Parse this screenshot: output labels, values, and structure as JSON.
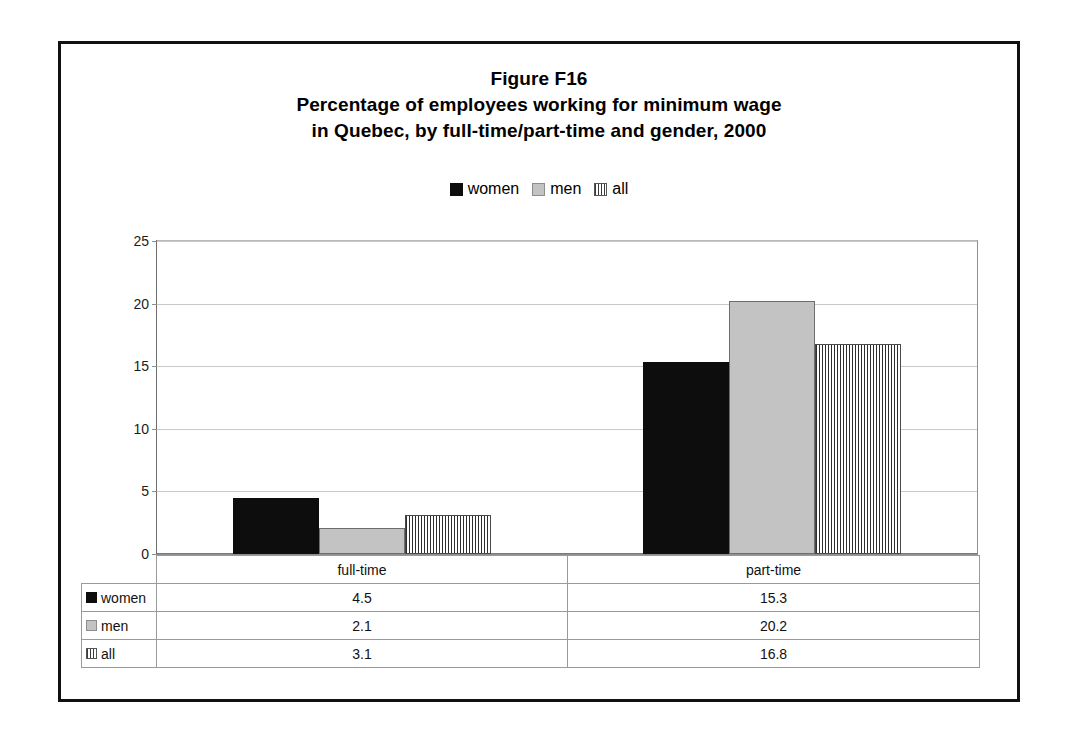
{
  "figure": {
    "title_lines": [
      "Figure F16",
      "Percentage of employees working for minimum wage",
      "in Quebec, by full-time/part-time and gender, 2000"
    ]
  },
  "legend": {
    "entries": [
      {
        "label": "women",
        "swatch": "solid-black-square-icon"
      },
      {
        "label": "men",
        "swatch": "solid-gray-square-icon"
      },
      {
        "label": "all",
        "swatch": "vertical-stripe-square-icon"
      }
    ]
  },
  "table": {
    "corner_label": "",
    "column_headers": [
      "full-time",
      "part-time"
    ],
    "rows": [
      {
        "series": "women",
        "values": [
          "4.5",
          "15.3"
        ]
      },
      {
        "series": "men",
        "values": [
          "2.1",
          "20.2"
        ]
      },
      {
        "series": "all",
        "values": [
          "3.1",
          "16.8"
        ]
      }
    ]
  },
  "axis": {
    "y_ticks": [
      "0",
      "5",
      "10",
      "15",
      "20",
      "25"
    ]
  },
  "colors": {
    "women": "#0d0d0d",
    "men": "#c3c3c3",
    "all_stripe": "#2e2e2e",
    "gridline": "#c9c9c9",
    "frame": "#111111"
  },
  "chart_data": {
    "type": "bar",
    "categories": [
      "full-time",
      "part-time"
    ],
    "series": [
      {
        "name": "women",
        "values": [
          4.5,
          15.3
        ]
      },
      {
        "name": "men",
        "values": [
          2.1,
          20.2
        ]
      },
      {
        "name": "all",
        "values": [
          3.1,
          16.8
        ]
      }
    ],
    "xlabel": "",
    "ylabel": "",
    "ylim": [
      0,
      25
    ],
    "ytick_step": 5,
    "grid": true,
    "legend_position": "top-center",
    "data_table_below": true
  }
}
